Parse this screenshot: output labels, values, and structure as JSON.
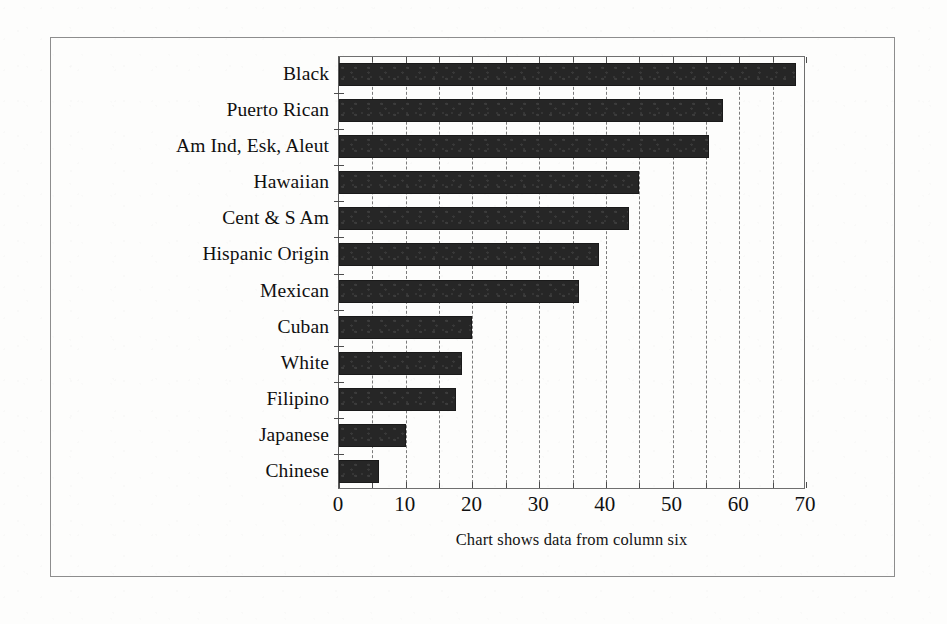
{
  "figure": {
    "caption": "Chart shows data from column six",
    "frame_color": "#8d8d8d",
    "background_color": "#fdfdfc"
  },
  "chart_data": {
    "type": "bar",
    "orientation": "horizontal",
    "title": "",
    "subtitle": "",
    "xlabel": "",
    "ylabel": "",
    "xlim": [
      0,
      70
    ],
    "ylim": null,
    "grid": "vertical dashed gridlines every 5 units",
    "legend": null,
    "legend_position": "none",
    "bar_color": "#262626",
    "categories": [
      "Black",
      "Puerto Rican",
      "Am Ind, Esk, Aleut",
      "Hawaiian",
      "Cent & S Am",
      "Hispanic Origin",
      "Mexican",
      "Cuban",
      "White",
      "Filipino",
      "Japanese",
      "Chinese"
    ],
    "values": [
      68.5,
      57.5,
      55.5,
      45.0,
      43.5,
      39.0,
      36.0,
      20.0,
      18.5,
      17.5,
      10.0,
      6.0
    ],
    "xticks": [
      0,
      10,
      20,
      30,
      40,
      50,
      60,
      70
    ],
    "xtick_labels": [
      "0",
      "10",
      "20",
      "30",
      "40",
      "50",
      "60",
      "70"
    ],
    "xminor_ticks": [
      5,
      15,
      25,
      35,
      45,
      55,
      65
    ],
    "annotations": [
      "Chart shows data from column six"
    ]
  }
}
